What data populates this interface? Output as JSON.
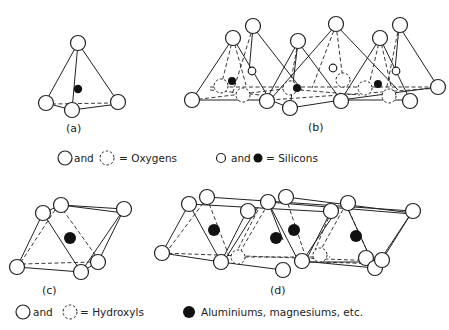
{
  "figure": {
    "panels": [
      {
        "id": "a",
        "label": "(a)",
        "description": "Single silica tetrahedron"
      },
      {
        "id": "b",
        "label": "(b)",
        "description": "Sheet of silica tetrahedra"
      },
      {
        "id": "c",
        "label": "(c)",
        "description": "Single octahedral unit"
      },
      {
        "id": "d",
        "label": "(d)",
        "description": "Sheet of octahedral units"
      }
    ],
    "legends": {
      "oxygens": {
        "text1": "and",
        "text2": "= Oxygens"
      },
      "silicons": {
        "text1": "and",
        "text2": "= Silicons"
      },
      "hydroxyls": {
        "text1": "and",
        "text2": "= Hydroxyls"
      },
      "cations": {
        "text": "Aluminiums, magnesiums, etc."
      }
    },
    "colors": {
      "ink": "#222222",
      "background": "#ffffff"
    }
  }
}
